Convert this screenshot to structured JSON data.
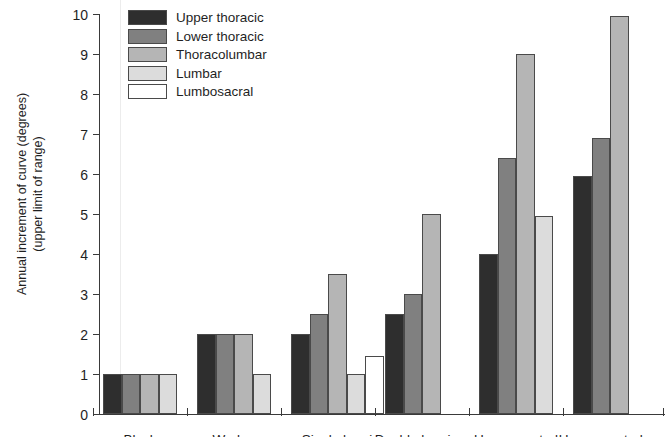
{
  "chart_data": {
    "type": "bar",
    "title": "",
    "xlabel": "",
    "ylabel": "Annual increment of curve (degrees) (upper limit of range)",
    "ylabel_line1": "Annual increment of curve (degrees)",
    "ylabel_line2": "(upper limit of range)",
    "ylim": [
      0,
      10
    ],
    "ytick_labels": [
      "0",
      "1",
      "2",
      "3",
      "4",
      "5",
      "6",
      "7",
      "8",
      "9",
      "10"
    ],
    "ytick_values": [
      0,
      1,
      2,
      3,
      4,
      5,
      6,
      7,
      8,
      9,
      10
    ],
    "grid": false,
    "legend_position": "top-left-inside",
    "categories": [
      "Block",
      "Wedge",
      "Single hemi",
      "Double hemi",
      "Unsegmented",
      "Unsegmented"
    ],
    "series": [
      {
        "name": "Upper thoracic",
        "color": "#2e2e2e",
        "values": [
          1,
          2,
          2,
          2.5,
          4.0,
          5.95
        ]
      },
      {
        "name": "Lower thoracic",
        "color": "#808080",
        "values": [
          1,
          2,
          2.5,
          3.0,
          6.4,
          6.9
        ]
      },
      {
        "name": "Thoracolumbar",
        "color": "#b5b5b5",
        "values": [
          1,
          2,
          3.5,
          5.0,
          9.0,
          9.95
        ]
      },
      {
        "name": "Lumbar",
        "color": "#dcdcdc",
        "values": [
          1,
          1,
          1.0,
          null,
          4.95,
          null
        ]
      },
      {
        "name": "Lumbosacral",
        "color": "#ffffff",
        "values": [
          null,
          null,
          1.45,
          null,
          null,
          null
        ]
      }
    ]
  },
  "legend": {
    "items": [
      {
        "label": "Upper thoracic",
        "color": "#2e2e2e"
      },
      {
        "label": "Lower thoracic",
        "color": "#808080"
      },
      {
        "label": "Thoracolumbar",
        "color": "#b5b5b5"
      },
      {
        "label": "Lumbar",
        "color": "#dcdcdc"
      },
      {
        "label": "Lumbosacral",
        "color": "#ffffff"
      }
    ]
  }
}
